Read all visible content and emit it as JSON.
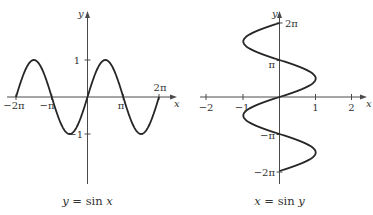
{
  "chart_data": [
    {
      "type": "line",
      "title": "y = sin x",
      "caption": {
        "var": "y",
        "eq": " = sin ",
        "arg": "x"
      },
      "xlabel": "x",
      "ylabel": "y",
      "function": "y = sin(x)",
      "xlim": [
        -6.2832,
        6.2832
      ],
      "ylim": [
        -1,
        1
      ],
      "x_ticks": [
        {
          "value": -6.2832,
          "label": "−2π"
        },
        {
          "value": -3.1416,
          "label": "−π"
        },
        {
          "value": 3.1416,
          "label": "π"
        },
        {
          "value": 6.2832,
          "label": "2π"
        }
      ],
      "y_ticks": [
        {
          "value": 1,
          "label": "1"
        },
        {
          "value": -1,
          "label": "−1"
        }
      ],
      "grid": false,
      "legend": null
    },
    {
      "type": "line",
      "title": "x = sin y",
      "caption": {
        "var": "x",
        "eq": " = sin ",
        "arg": "y"
      },
      "xlabel": "x",
      "ylabel": "y",
      "function": "x = sin(y)",
      "xlim": [
        -2,
        2
      ],
      "ylim": [
        -6.2832,
        6.2832
      ],
      "x_ticks": [
        {
          "value": -2,
          "label": "−2"
        },
        {
          "value": -1,
          "label": "−1"
        },
        {
          "value": 1,
          "label": "1"
        },
        {
          "value": 2,
          "label": "2"
        }
      ],
      "y_ticks": [
        {
          "value": 6.2832,
          "label": "2π"
        },
        {
          "value": 3.1416,
          "label": "π"
        },
        {
          "value": -3.1416,
          "label": "−π"
        },
        {
          "value": -6.2832,
          "label": "−2π"
        }
      ],
      "grid": false,
      "legend": null
    }
  ],
  "left": {
    "caption_var": "y",
    "caption_eq": " = sin ",
    "caption_arg": "x",
    "axis_x_label": "x",
    "axis_y_label": "y",
    "tick_neg2pi": "−2π",
    "tick_negpi": "−π",
    "tick_pi": "π",
    "tick_2pi": "2π",
    "tick_1": "1",
    "tick_neg1": "−1"
  },
  "right": {
    "caption_var": "x",
    "caption_eq": " = sin ",
    "caption_arg": "y",
    "axis_x_label": "x",
    "axis_y_label": "y",
    "tick_neg2": "−2",
    "tick_neg1": "−1",
    "tick_1": "1",
    "tick_2": "2",
    "tick_2pi": "2π",
    "tick_pi": "π",
    "tick_negpi": "−π",
    "tick_neg2pi": "−2π"
  }
}
